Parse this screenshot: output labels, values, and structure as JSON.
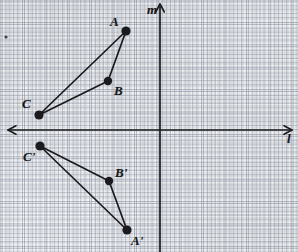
{
  "figure": {
    "background_color": "#fdfdfc",
    "ink_color": "#1b1b1f",
    "grid_color": "#6a7387",
    "axes": {
      "horizontal": {
        "name": "l",
        "label": "l",
        "y": 130,
        "x_start": 8,
        "x_end": 292,
        "arrow_left": true,
        "arrow_right": true
      },
      "vertical": {
        "name": "m",
        "label": "m",
        "x": 160,
        "y_start": 4,
        "y_end": 252,
        "arrow_up": true,
        "arrow_down": false
      }
    },
    "stray_mark": {
      "label": "",
      "x": 6,
      "y": 37,
      "r": 1.6
    },
    "points": [
      {
        "id": "A",
        "label": "A",
        "x": 126,
        "y": 31,
        "label_x": 110,
        "label_y": 15,
        "dot_r": 4.6
      },
      {
        "id": "B",
        "label": "B",
        "x": 108,
        "y": 81,
        "label_x": 114,
        "label_y": 84,
        "dot_r": 4.2
      },
      {
        "id": "C",
        "label": "C",
        "x": 39,
        "y": 115,
        "label_x": 22,
        "label_y": 97,
        "dot_r": 4.6
      },
      {
        "id": "A'",
        "label": "A'",
        "x": 127,
        "y": 230,
        "label_x": 131,
        "label_y": 234,
        "dot_r": 4.6
      },
      {
        "id": "B'",
        "label": "B'",
        "x": 109,
        "y": 181,
        "label_x": 115,
        "label_y": 166,
        "dot_r": 4.2
      },
      {
        "id": "C'",
        "label": "C'",
        "x": 40,
        "y": 146,
        "label_x": 23,
        "label_y": 150,
        "dot_r": 4.6
      }
    ],
    "polygons": [
      {
        "id": "triangle-ABC",
        "vertices": [
          "A",
          "B",
          "C"
        ],
        "closed": true
      },
      {
        "id": "triangle-ABC-prime",
        "vertices": [
          "A'",
          "B'",
          "C'"
        ],
        "closed": true
      }
    ]
  },
  "chart_data": {
    "type": "scatter",
    "xlabel": "l",
    "ylabel": "m",
    "grid": true,
    "legend": "none",
    "note": "Pre-image triangle ABC lies above line l; image triangle A'B'C' lies below line l.",
    "series": [
      {
        "name": "Triangle ABC",
        "points": [
          {
            "label": "A",
            "px": 126,
            "py": 31
          },
          {
            "label": "B",
            "px": 108,
            "py": 81
          },
          {
            "label": "C",
            "px": 39,
            "py": 115
          }
        ]
      },
      {
        "name": "Triangle A'B'C'",
        "points": [
          {
            "label": "A'",
            "px": 127,
            "py": 230
          },
          {
            "label": "B'",
            "px": 109,
            "py": 181
          },
          {
            "label": "C'",
            "px": 40,
            "py": 146
          }
        ]
      }
    ]
  }
}
